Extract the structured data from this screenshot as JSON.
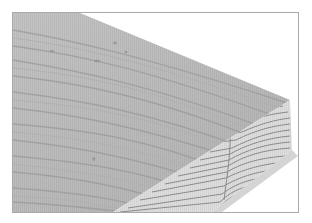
{
  "illustration": {
    "subject": "wood board with grain",
    "faces": [
      "top-face",
      "end-grain-face"
    ],
    "colors": {
      "frame_border": "#a9a9a9",
      "top_face": "#bcbcbc",
      "top_face_grain": "#9a9a9a",
      "end_grain_face": "#dcdcdc",
      "end_grain_lines": "#8c8c8c",
      "shadow": "#c8c8c8",
      "background": "#ffffff"
    }
  }
}
